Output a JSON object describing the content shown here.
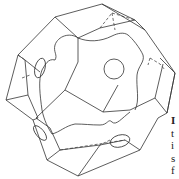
{
  "figure": {
    "stroke_color": "#333333",
    "background": "#ffffff"
  },
  "caption_fragment": {
    "letters": [
      "I",
      "t",
      "i",
      "s",
      "f"
    ]
  }
}
